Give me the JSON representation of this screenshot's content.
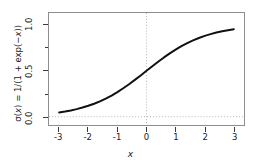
{
  "figure": {
    "background_color": "#ffffff",
    "frame_color": "#8d8d8d",
    "curve_color": "#111111",
    "grid_color": "#b4b4b4"
  },
  "chart_data": {
    "type": "line",
    "title": "",
    "subtitle": "",
    "xlabel": "x",
    "ylabel": "σ(x) = 1/(1 + exp(−x))",
    "xlim": [
      -3.35,
      3.35
    ],
    "ylim": [
      -0.09,
      1.13
    ],
    "grid": true,
    "grid_lines": [
      {
        "axis": "x",
        "value": 0,
        "style": "dotted"
      },
      {
        "axis": "y",
        "value": 0,
        "style": "dotted"
      }
    ],
    "legend": null,
    "legend_position": "none",
    "xticks": [
      -3,
      -2,
      -1,
      0,
      1,
      2,
      3
    ],
    "xticklabels": [
      "-3",
      "-2",
      "-1",
      "0",
      "1",
      "2",
      "3"
    ],
    "yticks": [
      0.0,
      0.25,
      0.5,
      0.75,
      1.0
    ],
    "yticklabels": [
      "0.0",
      "",
      "0.5",
      "",
      "1.0"
    ],
    "series": [
      {
        "name": "sigmoid",
        "color": "#111111",
        "linewidth": 2,
        "x": [
          -3.0,
          -2.8,
          -2.6,
          -2.4,
          -2.2,
          -2.0,
          -1.8,
          -1.6,
          -1.4,
          -1.2,
          -1.0,
          -0.8,
          -0.6,
          -0.4,
          -0.2,
          0.0,
          0.2,
          0.4,
          0.6,
          0.8,
          1.0,
          1.2,
          1.4,
          1.6,
          1.8,
          2.0,
          2.2,
          2.4,
          2.6,
          2.8,
          3.0
        ],
        "y": [
          0.047,
          0.057,
          0.069,
          0.083,
          0.1,
          0.119,
          0.142,
          0.168,
          0.198,
          0.231,
          0.269,
          0.31,
          0.354,
          0.401,
          0.45,
          0.5,
          0.55,
          0.599,
          0.646,
          0.69,
          0.731,
          0.769,
          0.802,
          0.832,
          0.858,
          0.881,
          0.9,
          0.917,
          0.931,
          0.943,
          0.953
        ]
      }
    ]
  },
  "axis_titles": {
    "y_sigma": "σ(",
    "y_x": "x",
    "y_rest": ") = 1/(1 + exp(−",
    "y_x2": "x",
    "y_end": "))",
    "x": "x"
  }
}
